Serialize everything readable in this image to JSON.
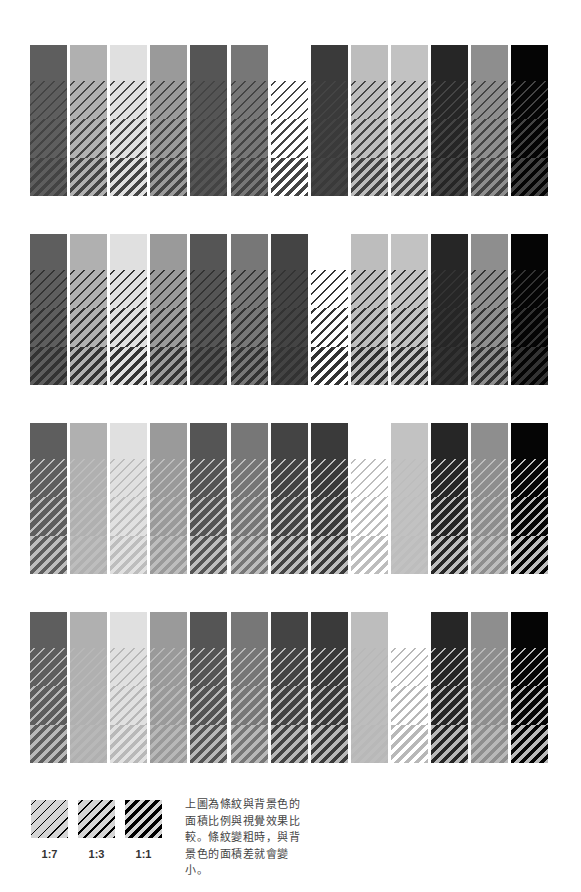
{
  "figure": {
    "rows": [
      {
        "stripe_color": "#444444",
        "colors": [
          "#5e5e5e",
          "#b0b0b0",
          "#e0e0e0",
          "#9a9a9a",
          "#555555",
          "#777777",
          "#ffffff",
          "#3a3a3a",
          "#bdbdbd",
          "#c2c2c2",
          "#262626",
          "#8e8e8e",
          "#050505"
        ]
      },
      {
        "stripe_color": "#333333",
        "colors": [
          "#5e5e5e",
          "#b0b0b0",
          "#e0e0e0",
          "#9a9a9a",
          "#555555",
          "#777777",
          "#444444",
          "#ffffff",
          "#bdbdbd",
          "#c2c2c2",
          "#262626",
          "#8e8e8e",
          "#050505"
        ]
      },
      {
        "stripe_color": "#bdbdbd",
        "colors": [
          "#5e5e5e",
          "#b0b0b0",
          "#e0e0e0",
          "#9a9a9a",
          "#555555",
          "#777777",
          "#444444",
          "#3a3a3a",
          "#ffffff",
          "#c2c2c2",
          "#262626",
          "#8e8e8e",
          "#050505"
        ]
      },
      {
        "stripe_color": "#b8b8b8",
        "colors": [
          "#5e5e5e",
          "#b0b0b0",
          "#e0e0e0",
          "#9a9a9a",
          "#555555",
          "#777777",
          "#444444",
          "#3a3a3a",
          "#bdbdbd",
          "#ffffff",
          "#262626",
          "#8e8e8e",
          "#050505"
        ]
      }
    ],
    "segments": [
      {
        "type": "solid"
      },
      {
        "type": "hatch",
        "ratio": "1:7"
      },
      {
        "type": "hatch",
        "ratio": "1:3"
      },
      {
        "type": "hatch",
        "ratio": "1:1"
      }
    ]
  },
  "legend": {
    "swatch_bg": "#d4d4d4",
    "stripe_color": "#000000",
    "items": [
      {
        "label": "1:7",
        "ratio": 0.125
      },
      {
        "label": "1:3",
        "ratio": 0.25
      },
      {
        "label": "1:1",
        "ratio": 0.5
      }
    ],
    "caption": "上圖為條紋與背景色的面積比例與視覺效果比較。條紋變粗時，與背景色的面積差就會變小。"
  }
}
